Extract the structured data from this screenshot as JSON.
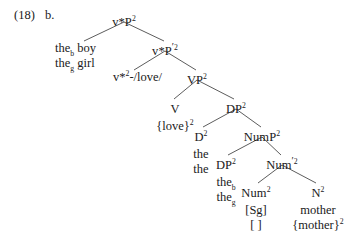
{
  "figure": {
    "example_number": "(18)",
    "sub_label": "b.",
    "style": {
      "text_color": "#1a1a1a",
      "branch_color": "#4a4a4a",
      "background": "#ffffff"
    }
  },
  "tree": {
    "nodes": [
      {
        "id": "vstarP",
        "label_base": "v*P",
        "prime": "",
        "superscript": "2",
        "x": 124,
        "y": 16
      },
      {
        "id": "vstarPbar",
        "label_base": "v*P",
        "prime": "′",
        "superscript": "2",
        "x": 165,
        "y": 45
      },
      {
        "id": "VP",
        "label_base": "VP",
        "prime": "",
        "superscript": "2",
        "x": 197,
        "y": 74
      },
      {
        "id": "V",
        "label_base": "V",
        "prime": "",
        "superscript": "",
        "x": 175,
        "y": 103
      },
      {
        "id": "DPupper",
        "label_base": "DP",
        "prime": "",
        "superscript": "2",
        "x": 236,
        "y": 103
      },
      {
        "id": "D",
        "label_base": "D",
        "prime": "",
        "superscript": "2",
        "x": 201,
        "y": 131
      },
      {
        "id": "NumP",
        "label_base": "NumP",
        "prime": "",
        "superscript": "2",
        "x": 262,
        "y": 131
      },
      {
        "id": "DPlower",
        "label_base": "DP",
        "prime": "",
        "superscript": "2",
        "x": 226,
        "y": 159
      },
      {
        "id": "Numbar",
        "label_base": "Num",
        "prime": "′",
        "superscript": "2",
        "x": 282,
        "y": 159
      },
      {
        "id": "Num",
        "label_base": "Num",
        "prime": "",
        "superscript": "2",
        "x": 256,
        "y": 187
      },
      {
        "id": "N",
        "label_base": "N",
        "prime": "",
        "superscript": "2",
        "x": 318,
        "y": 187
      }
    ],
    "branches": [
      {
        "from": "vstarP",
        "to": "specifier-boy-girl",
        "x1": 124,
        "y1": 22,
        "x2": 84,
        "y2": 41
      },
      {
        "from": "vstarP",
        "to": "vstarPbar",
        "x1": 124,
        "y1": 22,
        "x2": 164,
        "y2": 41
      },
      {
        "from": "vstarPbar",
        "to": "vstar-love",
        "x1": 165,
        "y1": 51,
        "x2": 134,
        "y2": 70
      },
      {
        "from": "vstarPbar",
        "to": "VP",
        "x1": 165,
        "y1": 51,
        "x2": 196,
        "y2": 70
      },
      {
        "from": "VP",
        "to": "V",
        "x1": 197,
        "y1": 80,
        "x2": 174,
        "y2": 99
      },
      {
        "from": "VP",
        "to": "DPupper",
        "x1": 197,
        "y1": 80,
        "x2": 234,
        "y2": 99
      },
      {
        "from": "DPupper",
        "to": "D",
        "x1": 236,
        "y1": 109,
        "x2": 203,
        "y2": 127
      },
      {
        "from": "DPupper",
        "to": "NumP",
        "x1": 236,
        "y1": 109,
        "x2": 261,
        "y2": 127
      },
      {
        "from": "NumP",
        "to": "DPlower",
        "x1": 262,
        "y1": 137,
        "x2": 228,
        "y2": 155
      },
      {
        "from": "NumP",
        "to": "Numbar",
        "x1": 262,
        "y1": 137,
        "x2": 281,
        "y2": 155
      },
      {
        "from": "Numbar",
        "to": "Num",
        "x1": 282,
        "y1": 165,
        "x2": 258,
        "y2": 183
      },
      {
        "from": "Numbar",
        "to": "N",
        "x1": 282,
        "y1": 165,
        "x2": 316,
        "y2": 183
      }
    ]
  },
  "terminals": {
    "specifier_subject": {
      "line1_word": "the",
      "line1_subscript": "b",
      "line1_noun": "boy",
      "line2_word": "the",
      "line2_subscript": "g",
      "line2_noun": "girl",
      "x": 55,
      "y": 41
    },
    "vstar_love": {
      "label_base": "v*",
      "superscript": "2",
      "suffix": "-/love/",
      "x": 113,
      "y": 70
    },
    "v_exponent": {
      "text_open": "{love}",
      "superscript": "2",
      "x": 175,
      "y": 119
    },
    "d_exponents": {
      "line1": "the",
      "line2": "the",
      "x": 201,
      "y": 147
    },
    "dp_lower_exponents": {
      "line1_word": "the",
      "line1_subscript": "b",
      "line2_word": "the",
      "line2_subscript": "g",
      "x": 226,
      "y": 175
    },
    "num_features": {
      "line1": "[Sg]",
      "line2": "[  ]",
      "x": 256,
      "y": 203
    },
    "n_exponents": {
      "line1": "mother",
      "line2_open": "{mother}",
      "line2_superscript": "2",
      "x": 318,
      "y": 203
    }
  }
}
